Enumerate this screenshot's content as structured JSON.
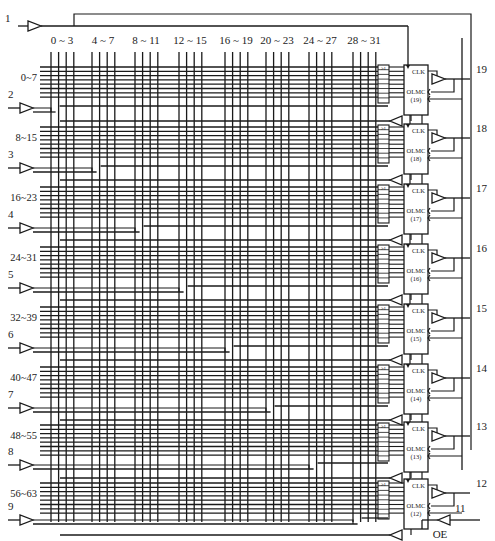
{
  "diagram": {
    "title": "",
    "column_groups": [
      "0 ~ 3",
      "4 ~ 7",
      "8 ~ 11",
      "12 ~ 15",
      "16 ~ 19",
      "20 ~ 23",
      "24 ~ 27",
      "28 ~ 31"
    ],
    "row_groups": [
      "0~7",
      "8~15",
      "16~23",
      "24~31",
      "32~39",
      "40~47",
      "48~55",
      "56~63"
    ],
    "input_pins": [
      "1",
      "2",
      "3",
      "4",
      "5",
      "6",
      "7",
      "8",
      "9"
    ],
    "olmc": [
      {
        "clk": "CLK",
        "name": "OLMC",
        "index": "(19)",
        "pin": "19"
      },
      {
        "clk": "CLK",
        "name": "OLMC",
        "index": "(18)",
        "pin": "18"
      },
      {
        "clk": "CLK",
        "name": "OLMC",
        "index": "(17)",
        "pin": "17"
      },
      {
        "clk": "CLK",
        "name": "OLMC",
        "index": "(16)",
        "pin": "16"
      },
      {
        "clk": "CLK",
        "name": "OLMC",
        "index": "(15)",
        "pin": "15"
      },
      {
        "clk": "CLK",
        "name": "OLMC",
        "index": "(14)",
        "pin": "14"
      },
      {
        "clk": "CLK",
        "name": "OLMC",
        "index": "(13)",
        "pin": "13"
      },
      {
        "clk": "CLK",
        "name": "OLMC",
        "index": "(12)",
        "pin": "12"
      }
    ],
    "or_gate_symbol": "≥1",
    "oe_pin": "11",
    "oe_label": "OE",
    "colors": {
      "line": "#1a1a1a",
      "background": "#ffffff"
    }
  }
}
